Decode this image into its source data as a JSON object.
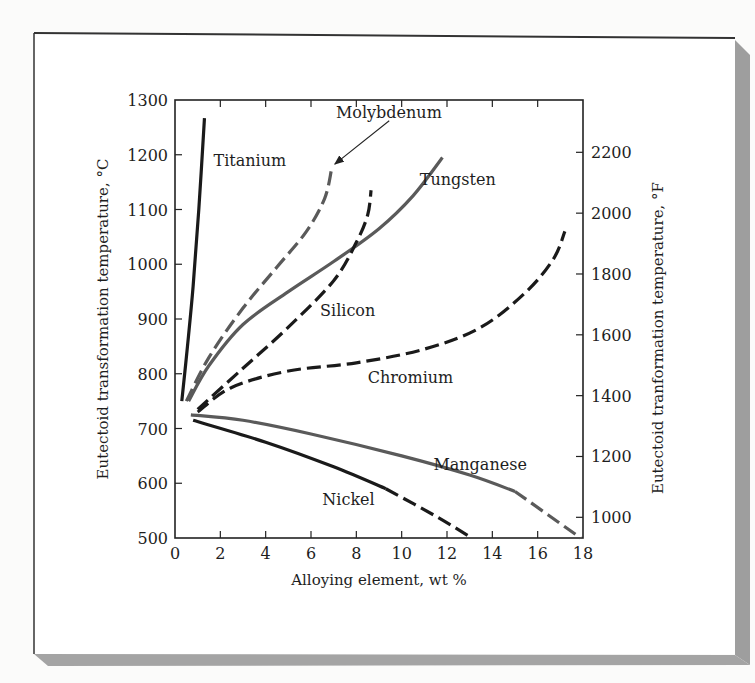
{
  "figure": {
    "frame_color": "#333333",
    "shadow_color": "#9a9a9a",
    "paper_color": "#ffffff"
  },
  "chart_data": {
    "type": "line",
    "title": "",
    "xlabel": "Alloying element, wt %",
    "ylabel": "Eutectoid transformation temperature, °C",
    "ylabel_right": "Eutectoid tranformation temperature, °F",
    "xlim": [
      0,
      18
    ],
    "ylim": [
      500,
      1300
    ],
    "x_ticks": [
      0,
      2,
      4,
      6,
      8,
      10,
      12,
      14,
      16,
      18
    ],
    "y_ticks": [
      500,
      600,
      700,
      800,
      900,
      1000,
      1100,
      1200,
      1300
    ],
    "y_right_ticks": [
      1000,
      1200,
      1400,
      1600,
      1800,
      2000,
      2200
    ],
    "grid": false,
    "legend": "inline labels",
    "series": [
      {
        "name": "Titanium",
        "color": "#1a1a1a",
        "style": "solid",
        "points": [
          [
            0.3,
            750
          ],
          [
            0.55,
            850
          ],
          [
            0.8,
            960
          ],
          [
            1.05,
            1100
          ],
          [
            1.3,
            1267
          ]
        ],
        "label_pos": [
          1.7,
          1180
        ]
      },
      {
        "name": "Molybdenum",
        "color": "#5a5a5a",
        "style": "dashed",
        "points": [
          [
            0.5,
            750
          ],
          [
            1.5,
            830
          ],
          [
            3.0,
            920
          ],
          [
            4.5,
            995
          ],
          [
            5.8,
            1060
          ],
          [
            6.6,
            1120
          ],
          [
            6.9,
            1172
          ]
        ],
        "label_pos": [
          7.1,
          1268
        ]
      },
      {
        "name": "Tungsten",
        "color": "#5a5a5a",
        "style": "solid",
        "points": [
          [
            0.6,
            750
          ],
          [
            1.5,
            815
          ],
          [
            3.0,
            890
          ],
          [
            5.0,
            950
          ],
          [
            7.0,
            1005
          ],
          [
            9.0,
            1065
          ],
          [
            10.5,
            1125
          ],
          [
            11.8,
            1195
          ]
        ],
        "label_pos": [
          10.8,
          1145
        ]
      },
      {
        "name": "Silicon",
        "color": "#1a1a1a",
        "style": "dashed",
        "points": [
          [
            1.0,
            735
          ],
          [
            3.0,
            810
          ],
          [
            5.0,
            885
          ],
          [
            7.0,
            970
          ],
          [
            8.0,
            1040
          ],
          [
            8.5,
            1090
          ],
          [
            8.65,
            1135
          ]
        ],
        "label_pos": [
          6.4,
          905
        ]
      },
      {
        "name": "Chromium",
        "color": "#1a1a1a",
        "style": "dashed",
        "points": [
          [
            1.0,
            730
          ],
          [
            2.5,
            775
          ],
          [
            5.0,
            805
          ],
          [
            8.0,
            820
          ],
          [
            11.0,
            845
          ],
          [
            13.5,
            885
          ],
          [
            15.5,
            950
          ],
          [
            16.7,
            1010
          ],
          [
            17.2,
            1060
          ]
        ],
        "label_pos": [
          8.5,
          783
        ]
      },
      {
        "name": "Manganese",
        "color": "#5a5a5a",
        "style": "solid-then-dashed",
        "dash_from_x": 15.0,
        "points": [
          [
            0.7,
            725
          ],
          [
            3.0,
            715
          ],
          [
            6.0,
            690
          ],
          [
            10.0,
            650
          ],
          [
            13.0,
            615
          ],
          [
            15.0,
            585
          ],
          [
            17.9,
            500
          ]
        ],
        "label_pos": [
          11.4,
          625
        ]
      },
      {
        "name": "Nickel",
        "color": "#1a1a1a",
        "style": "solid-then-dashed",
        "dash_from_x": 9.3,
        "points": [
          [
            0.8,
            715
          ],
          [
            4.0,
            675
          ],
          [
            7.0,
            630
          ],
          [
            9.3,
            590
          ],
          [
            11.5,
            540
          ],
          [
            13.1,
            500
          ]
        ],
        "label_pos": [
          6.5,
          560
        ]
      }
    ],
    "annotations": [
      {
        "type": "arrow",
        "from": [
          9.45,
          1262
        ],
        "to": [
          7.05,
          1183
        ],
        "label": "Molybdenum"
      }
    ]
  },
  "ghost_text": [
    "Steels",
    "Elemental",
    "Carbide",
    "Compounds",
    "Fe-Cr-C",
    "Mo, W",
    "Ni, Si"
  ]
}
